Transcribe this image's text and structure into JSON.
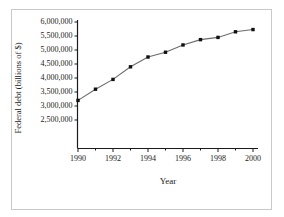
{
  "chart_data": {
    "type": "line",
    "title": "",
    "xlabel": "Year",
    "ylabel": "Federal debt (billions of $)",
    "x": [
      1990,
      1991,
      1992,
      1993,
      1994,
      1995,
      1996,
      1997,
      1998,
      1999,
      2000
    ],
    "values": [
      3200000,
      3600000,
      3950000,
      4400000,
      4750000,
      4920000,
      5180000,
      5370000,
      5450000,
      5650000,
      5730000
    ],
    "series": [
      {
        "name": "Federal debt",
        "values": [
          3200000,
          3600000,
          3950000,
          4400000,
          4750000,
          4920000,
          5180000,
          5370000,
          5450000,
          5650000,
          5730000
        ]
      }
    ],
    "xlim": [
      1990,
      2000
    ],
    "ylim": [
      2500000,
      6000000
    ],
    "ytick_labels": [
      "6,000,000",
      "5,500,000",
      "5,000,000",
      "4,500,000",
      "4,000,000",
      "3,500,000",
      "3,000,000",
      "2,500,000"
    ],
    "ytick_values": [
      6000000,
      5500000,
      5000000,
      4500000,
      4000000,
      3500000,
      3000000,
      2500000
    ],
    "xtick_labels": [
      "1990",
      "1992",
      "1994",
      "1996",
      "1998",
      "2000"
    ],
    "xtick_values": [
      1990,
      1992,
      1994,
      1996,
      1998,
      2000
    ],
    "xminor_ticks": [
      1990,
      1991,
      1992,
      1993,
      1994,
      1995,
      1996,
      1997,
      1998,
      1999,
      2000
    ],
    "grid": false,
    "legend": "none",
    "marker": "square",
    "line_color": "#6b6b6b",
    "marker_color": "#111111",
    "axis_color": "#1a1a1a",
    "frame_color": "#c9c9c9",
    "background_color": "#ffffff"
  }
}
